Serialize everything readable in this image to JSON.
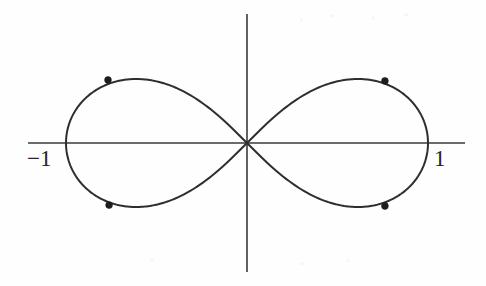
{
  "figure": {
    "background_color": "#fefefe",
    "curve_color": "#2e2e2e",
    "axis_color": "#3a3a3a",
    "marker_color": "#1d1d1d",
    "label_color": "#262626",
    "label_neg_one": "−1",
    "label_pos_one": "1"
  },
  "chart_data": {
    "type": "line",
    "title": "",
    "subtitle": "",
    "xlabel": "",
    "ylabel": "",
    "curve_name": "lemniscate of Bernoulli",
    "curve_equation": "(x^2 + y^2)^2 = x^2 - y^2",
    "polar_equation": "r^2 = cos(2*theta)",
    "grid": false,
    "legend": null,
    "axes": {
      "x_axis_visible": true,
      "y_axis_visible": true,
      "x_axis_pixel_span": [
        28,
        465
      ],
      "y_axis_pixel_span": [
        14,
        272
      ],
      "origin_pixel": [
        247,
        143
      ],
      "pixels_per_unit": 181
    },
    "xlim": [
      -1.21,
      1.2
    ],
    "ylim": [
      -0.71,
      0.71
    ],
    "tick_labels": {
      "x": [
        "−1",
        "1"
      ],
      "y": []
    },
    "tick_values": {
      "x": [
        -1,
        1
      ],
      "y": []
    },
    "annotations": [
      {
        "text": "−1",
        "x": -1.0,
        "y": 0.0,
        "placement": "below-left-of-axis-crossing"
      },
      {
        "text": "1",
        "x": 1.0,
        "y": 0.0,
        "placement": "below-right-of-axis-crossing"
      }
    ],
    "marked_points": [
      {
        "label": "",
        "x": -0.768,
        "y": 0.348
      },
      {
        "label": "",
        "x": 0.762,
        "y": 0.343
      },
      {
        "label": "",
        "x": -0.762,
        "y": -0.343
      },
      {
        "label": "",
        "x": 0.762,
        "y": -0.348
      }
    ],
    "series": [
      {
        "name": "lemniscate",
        "closed": true,
        "x": [
          1.0,
          0.995,
          0.98,
          0.955,
          0.92,
          0.874,
          0.816,
          0.743,
          0.65,
          0.53,
          0.36,
          0.0,
          -0.36,
          -0.53,
          -0.65,
          -0.743,
          -0.816,
          -0.874,
          -0.92,
          -0.955,
          -0.98,
          -0.995,
          -1.0
        ],
        "y": [
          0.0,
          0.077,
          0.15,
          0.216,
          0.272,
          0.316,
          0.346,
          0.357,
          0.347,
          0.306,
          0.22,
          0.0,
          -0.22,
          -0.306,
          -0.347,
          -0.357,
          -0.346,
          -0.316,
          -0.272,
          -0.216,
          -0.15,
          -0.077,
          0.0
        ]
      }
    ]
  }
}
